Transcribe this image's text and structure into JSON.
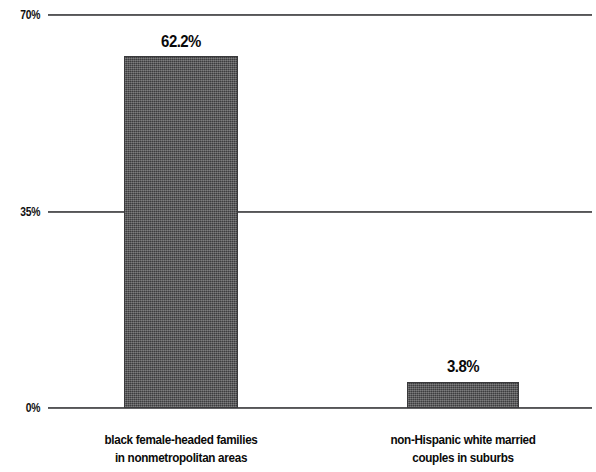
{
  "chart_data": {
    "type": "bar",
    "title": "",
    "subtitle": "",
    "xlabel": "",
    "ylabel": "",
    "ylim": [
      0,
      70
    ],
    "grid": true,
    "legend": false,
    "yticks": [
      "0%",
      "35%",
      "70%"
    ],
    "categories": [
      "black female-headed families in nonmetropolitan areas",
      "non-Hispanic white married couples in suburbs"
    ],
    "values": [
      62.2,
      3.8
    ],
    "value_labels": [
      "62.2%",
      "3.8%"
    ],
    "bar_color": "#4a4a4c"
  },
  "axis": {
    "y_tick_70": "70%",
    "y_tick_35": "35%",
    "y_tick_0": "0%"
  },
  "bars": [
    {
      "value_label": "62.2%",
      "cat_line_1": "black female-headed families",
      "cat_line_2": "in nonmetropolitan areas"
    },
    {
      "value_label": "3.8%",
      "cat_line_1": "non-Hispanic white married",
      "cat_line_2": "couples in suburbs"
    }
  ]
}
